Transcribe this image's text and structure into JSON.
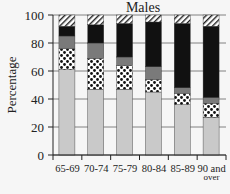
{
  "chart_data": {
    "type": "bar",
    "stacked": true,
    "title": "Males",
    "xlabel": "",
    "ylabel": "Percentage",
    "ylim": [
      0,
      100
    ],
    "yticks": [
      0,
      20,
      40,
      60,
      80,
      100
    ],
    "grid": "horizontal",
    "legend": "none visible",
    "categories": [
      "65-69",
      "70-74",
      "75-79",
      "80-84",
      "85-89",
      "90 and over"
    ],
    "series": [
      {
        "name": "light grey (bottom)",
        "pattern": "solid-light",
        "color": "#c9c9c9",
        "values": [
          61,
          47,
          47,
          45,
          36,
          27
        ]
      },
      {
        "name": "dotted",
        "pattern": "dots",
        "color": "#ffffff",
        "values": [
          15,
          22,
          17,
          9,
          8,
          10
        ]
      },
      {
        "name": "dark grey",
        "pattern": "solid-grey",
        "color": "#7a7a7a",
        "values": [
          9,
          11,
          6,
          9,
          4,
          4
        ]
      },
      {
        "name": "black",
        "pattern": "solid-black",
        "color": "#111111",
        "values": [
          7,
          13,
          24,
          32,
          46,
          51
        ]
      },
      {
        "name": "hatched (top)",
        "pattern": "hatch",
        "color": "#ffffff",
        "values": [
          8,
          7,
          6,
          5,
          6,
          8
        ]
      }
    ]
  },
  "labels": {
    "title": "Males",
    "ylabel": "Percentage",
    "xticks": [
      "65-69",
      "70-74",
      "75-79",
      "80-84",
      "85-89",
      "90 and",
      "over"
    ]
  }
}
